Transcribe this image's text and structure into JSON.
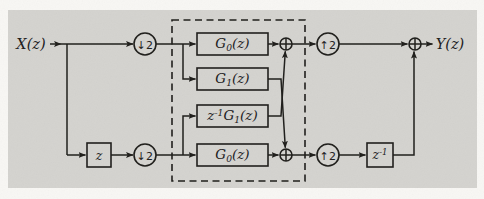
{
  "diagram": {
    "input_label": "X(z)",
    "output_label": "Y(z)",
    "samplers": {
      "down": "↓2",
      "up": "↑2"
    },
    "filters": {
      "g0_top": "G_0(z)",
      "g1": "G_1(z)",
      "zinv_g1": "z^-1G_1(z)",
      "g0_bottom": "G_0(z)"
    },
    "delays": {
      "z": "z",
      "z_inverse": "z^-1"
    },
    "colors": {
      "paper": "#f8f7f4",
      "panel": "#d4d3cf",
      "line": "#21201d"
    }
  }
}
